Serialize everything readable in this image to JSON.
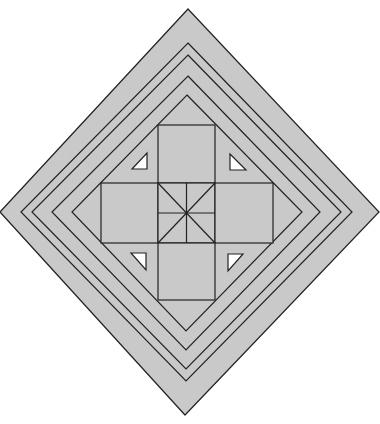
{
  "figure": {
    "width": 380,
    "height": 424,
    "background": "#ffffff",
    "fill": "#c9c9c9",
    "stroke": "#222222",
    "stroke_width": 1.2,
    "triangle_fill": "#ffffff",
    "outer_diamond": {
      "top": [
        188,
        9
      ],
      "right": [
        379,
        212
      ],
      "bottom": [
        185,
        415
      ],
      "left": [
        0,
        212
      ]
    },
    "nested_diamonds": [
      {
        "top": [
          188,
          43
        ],
        "right": [
          352,
          212
        ],
        "bottom": [
          186,
          381
        ],
        "left": [
          21,
          212
        ]
      },
      {
        "top": [
          188,
          55
        ],
        "right": [
          341,
          212
        ],
        "bottom": [
          186,
          369
        ],
        "left": [
          32,
          212
        ]
      },
      {
        "top": [
          188,
          76
        ],
        "right": [
          320,
          212
        ],
        "bottom": [
          186,
          350
        ],
        "left": [
          52,
          212
        ]
      },
      {
        "top": [
          187,
          95
        ],
        "right": [
          302,
          212
        ],
        "bottom": [
          186,
          331
        ],
        "left": [
          72,
          212
        ]
      }
    ],
    "squares": [
      {
        "name": "top-square",
        "x": 158,
        "y": 125,
        "w": 57,
        "h": 58
      },
      {
        "name": "left-square",
        "x": 101,
        "y": 183,
        "w": 57,
        "h": 60
      },
      {
        "name": "center-square",
        "x": 158,
        "y": 183,
        "w": 57,
        "h": 60
      },
      {
        "name": "right-square",
        "x": 215,
        "y": 183,
        "w": 58,
        "h": 60
      },
      {
        "name": "bottom-square",
        "x": 158,
        "y": 243,
        "w": 57,
        "h": 57
      }
    ],
    "center_lines": [
      [
        158,
        183,
        215,
        243
      ],
      [
        215,
        183,
        158,
        243
      ],
      [
        186.5,
        183,
        186.5,
        243
      ],
      [
        158,
        213,
        215,
        213
      ]
    ],
    "triangles": [
      {
        "name": "triangle-top-left",
        "points": "132,169 147,169 147,153"
      },
      {
        "name": "triangle-top-right",
        "points": "230,154 230,170 246,170"
      },
      {
        "name": "triangle-bottom-left",
        "points": "131,253 146,253 146,270"
      },
      {
        "name": "triangle-bottom-right",
        "points": "228,254 243,254 228,271"
      }
    ]
  }
}
